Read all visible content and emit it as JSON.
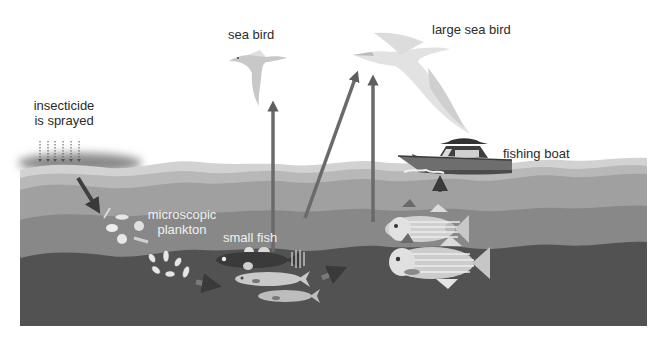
{
  "diagram": {
    "labels": {
      "insecticide": [
        "insecticide",
        "is sprayed"
      ],
      "sea_bird": "sea bird",
      "large_sea_bird": "large sea bird",
      "fishing_boat": "fishing boat",
      "plankton": [
        "microscopic",
        "plankton"
      ],
      "small_fish": "small fish"
    },
    "icons": {
      "spray": "dotted-down-arrows",
      "sea_bird": "bird-silhouette",
      "large_sea_bird": "albatross-silhouette",
      "boat": "fishing-boat",
      "plankton": "plankton-cluster",
      "small_fish": "small-fish-group",
      "large_fish": "striped-bass-pair"
    },
    "flow_arrows": [
      {
        "from": "insecticide",
        "to": "plankton"
      },
      {
        "from": "plankton",
        "to": "small fish"
      },
      {
        "from": "small fish",
        "to": "large fish"
      },
      {
        "from": "small fish",
        "to": "sea bird"
      },
      {
        "from": "small fish",
        "to": "large sea bird"
      },
      {
        "from": "large fish",
        "to": "large sea bird"
      },
      {
        "from": "large fish",
        "to": "fishing boat"
      }
    ],
    "colors": {
      "sky": "#ffffff",
      "water_surface": "#c9c9c9",
      "water_1": "#b3b3b3",
      "water_2": "#9c9c9c",
      "water_3": "#858585",
      "water_deep": "#4f4f4f",
      "arrow": "#5e5e5e",
      "text": "#2b2b2b"
    }
  }
}
